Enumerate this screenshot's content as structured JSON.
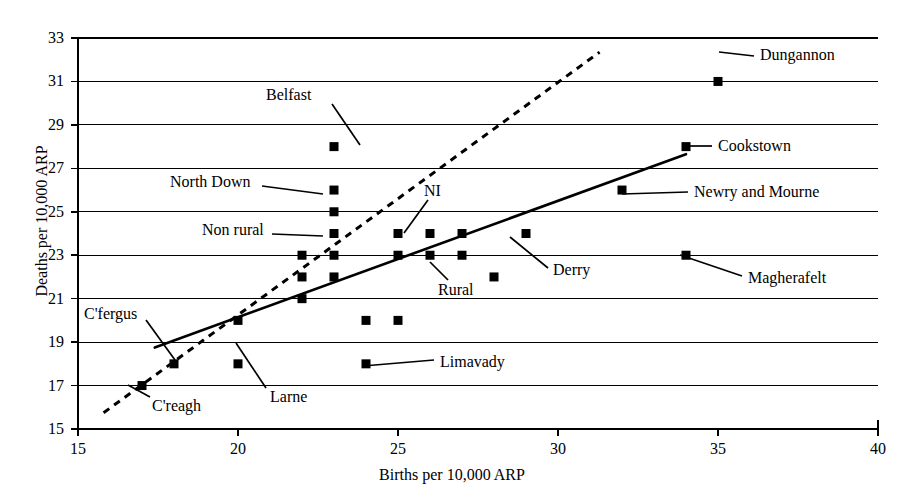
{
  "chart_data": {
    "type": "scatter",
    "title": "",
    "xlabel": "Births per 10,000 ARP",
    "ylabel": "Deaths per 10,000 ARP",
    "xlim": [
      15,
      40
    ],
    "ylim": [
      15,
      33
    ],
    "xticks": [
      15,
      20,
      25,
      30,
      35,
      40
    ],
    "yticks": [
      15,
      17,
      19,
      21,
      23,
      25,
      27,
      29,
      31,
      33
    ],
    "grid": "horizontal",
    "legend": "none",
    "marker": "filled-square",
    "points": [
      {
        "x": 17,
        "y": 17,
        "label": "C'reagh"
      },
      {
        "x": 18,
        "y": 18,
        "label": "C'fergus"
      },
      {
        "x": 20,
        "y": 20,
        "label": ""
      },
      {
        "x": 20,
        "y": 18,
        "label": "Larne"
      },
      {
        "x": 22,
        "y": 21,
        "label": ""
      },
      {
        "x": 22,
        "y": 22,
        "label": ""
      },
      {
        "x": 22,
        "y": 23,
        "label": ""
      },
      {
        "x": 23,
        "y": 28,
        "label": "Belfast"
      },
      {
        "x": 23,
        "y": 26,
        "label": "North Down"
      },
      {
        "x": 23,
        "y": 25,
        "label": ""
      },
      {
        "x": 23,
        "y": 24,
        "label": "Non rural"
      },
      {
        "x": 23,
        "y": 23,
        "label": ""
      },
      {
        "x": 23,
        "y": 22,
        "label": ""
      },
      {
        "x": 24,
        "y": 20,
        "label": ""
      },
      {
        "x": 24,
        "y": 18,
        "label": "Limavady"
      },
      {
        "x": 25,
        "y": 24,
        "label": "NI"
      },
      {
        "x": 25,
        "y": 23,
        "label": ""
      },
      {
        "x": 25,
        "y": 20,
        "label": ""
      },
      {
        "x": 26,
        "y": 24,
        "label": ""
      },
      {
        "x": 26,
        "y": 23,
        "label": "Rural"
      },
      {
        "x": 27,
        "y": 24,
        "label": ""
      },
      {
        "x": 27,
        "y": 23,
        "label": ""
      },
      {
        "x": 28,
        "y": 22,
        "label": ""
      },
      {
        "x": 29,
        "y": 24,
        "label": "Derry"
      },
      {
        "x": 32,
        "y": 26,
        "label": "Newry and Mourne"
      },
      {
        "x": 34,
        "y": 28,
        "label": "Cookstown"
      },
      {
        "x": 34,
        "y": 23,
        "label": "Magherafelt"
      },
      {
        "x": 35,
        "y": 31,
        "label": "Dungannon"
      }
    ],
    "lines": [
      {
        "name": "solid-trend-line",
        "style": "solid",
        "x0": 17.4,
        "y0": 18.75,
        "x1": 34.0,
        "y1": 27.65
      },
      {
        "name": "dashed-reference-line",
        "style": "dashed",
        "x0": 15.8,
        "y0": 15.75,
        "x1": 31.3,
        "y1": 32.35
      }
    ],
    "callouts": [
      {
        "name": "belfast",
        "text": "Belfast",
        "text_x": 266,
        "text_y": 86,
        "lx0": 332,
        "ly0": 104,
        "lx1": 360,
        "ly1": 145
      },
      {
        "name": "north-down",
        "text": "North Down",
        "text_x": 170,
        "text_y": 173,
        "lx0": 262,
        "ly0": 186,
        "lx1": 323,
        "ly1": 194
      },
      {
        "name": "non-rural",
        "text": "Non rural",
        "text_x": 202,
        "text_y": 221,
        "lx0": 272,
        "ly0": 234,
        "lx1": 323,
        "ly1": 236
      },
      {
        "name": "ni",
        "text": "NI",
        "text_x": 424,
        "text_y": 182,
        "lx0": 428,
        "ly0": 200,
        "lx1": 404,
        "ly1": 233
      },
      {
        "name": "cfergus",
        "text": "C'fergus",
        "text_x": 84,
        "text_y": 305,
        "lx0": 146,
        "ly0": 320,
        "lx1": 175,
        "ly1": 360
      },
      {
        "name": "creagh",
        "text": "C'reagh",
        "text_x": 152,
        "text_y": 397,
        "lx0": 150,
        "ly0": 397,
        "lx1": 128,
        "ly1": 385
      },
      {
        "name": "larne",
        "text": "Larne",
        "text_x": 270,
        "text_y": 388,
        "lx0": 266,
        "ly0": 388,
        "lx1": 236,
        "ly1": 343
      },
      {
        "name": "limavady",
        "text": "Limavady",
        "text_x": 440,
        "text_y": 353,
        "lx0": 434,
        "ly0": 360,
        "lx1": 363,
        "ly1": 366
      },
      {
        "name": "rural",
        "text": "Rural",
        "text_x": 438,
        "text_y": 281,
        "lx0": 448,
        "ly0": 280,
        "lx1": 430,
        "ly1": 262
      },
      {
        "name": "derry",
        "text": "Derry",
        "text_x": 553,
        "text_y": 261,
        "lx0": 548,
        "ly0": 268,
        "lx1": 510,
        "ly1": 237
      },
      {
        "name": "magherafelt",
        "text": "Magherafelt",
        "text_x": 748,
        "text_y": 269,
        "lx0": 742,
        "ly0": 276,
        "lx1": 680,
        "ly1": 255
      },
      {
        "name": "newry-and-mourne",
        "text": "Newry and Mourne",
        "text_x": 694,
        "text_y": 183,
        "lx0": 688,
        "ly0": 192,
        "lx1": 622,
        "ly1": 194
      },
      {
        "name": "cookstown",
        "text": "Cookstown",
        "text_x": 718,
        "text_y": 137,
        "lx0": 712,
        "ly0": 146,
        "lx1": 686,
        "ly1": 146
      },
      {
        "name": "dungannon",
        "text": "Dungannon",
        "text_x": 760,
        "text_y": 46,
        "lx0": 754,
        "ly0": 56,
        "lx1": 719,
        "ly1": 52
      }
    ]
  }
}
